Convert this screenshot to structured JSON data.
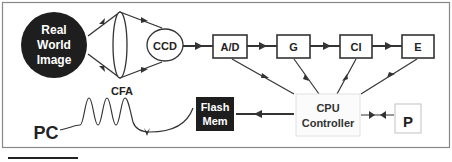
{
  "diagram": {
    "source": {
      "label_lines": [
        "Real",
        "World",
        "Image"
      ]
    },
    "sensor": {
      "label": "CCD"
    },
    "pipeline": [
      {
        "id": "ad",
        "label": "A/D"
      },
      {
        "id": "g",
        "label": "G"
      },
      {
        "id": "ci",
        "label": "CI"
      },
      {
        "id": "e",
        "label": "E"
      }
    ],
    "controller": {
      "label_lines": [
        "CPU",
        "Controller"
      ]
    },
    "storage": {
      "label_lines": [
        "Flash",
        "Mem"
      ]
    },
    "input": {
      "label": "P"
    },
    "output": {
      "label": "PC"
    },
    "cable": {
      "label": "CFA"
    },
    "colors": {
      "stroke": "#333333",
      "dark_fill": "#1e1e1e",
      "light_text": "#ffffff",
      "frame": "#888888",
      "ghost_box": "#cccccc"
    }
  }
}
